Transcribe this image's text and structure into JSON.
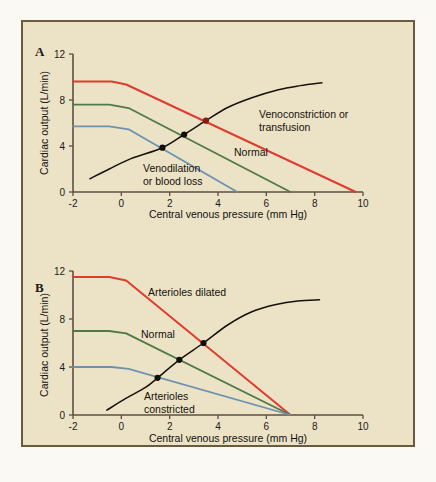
{
  "figure": {
    "background_color": "#ece3c6",
    "border_color": "#6b5b3e",
    "panels": [
      {
        "letter": "A",
        "xlabel": "Central venous pressure (mm Hg)",
        "ylabel": "Cardiac output (L/min)",
        "xticks": [
          "-2",
          "0",
          "2",
          "4",
          "6",
          "8",
          "10"
        ],
        "yticks": [
          "0",
          "4",
          "8",
          "12"
        ],
        "labels": {
          "red": "Venoconstriction or transfusion",
          "green": "Normal",
          "blue": "Venodilation or blood loss"
        }
      },
      {
        "letter": "B",
        "xlabel": "Central venous pressure (mm Hg)",
        "ylabel": "Cardiac output (L/min)",
        "xticks": [
          "-2",
          "0",
          "2",
          "4",
          "6",
          "8",
          "10"
        ],
        "yticks": [
          "0",
          "4",
          "8",
          "12"
        ],
        "labels": {
          "red": "Arterioles dilated",
          "green": "Normal",
          "blue": "Arterioles constricted"
        }
      }
    ]
  },
  "chart_data": [
    {
      "type": "line",
      "panel": "A",
      "title": "",
      "xlabel": "Central venous pressure (mm Hg)",
      "ylabel": "Cardiac output (L/min)",
      "xlim": [
        -2,
        10
      ],
      "ylim": [
        0,
        12
      ],
      "xticks": [
        -2,
        0,
        2,
        4,
        6,
        8,
        10
      ],
      "yticks": [
        0,
        4,
        8,
        12
      ],
      "grid": false,
      "legend": "inline-annotations",
      "series": [
        {
          "name": "Venoconstriction or transfusion",
          "color": "#e03b2e",
          "kind": "vascular-function-curve",
          "points": [
            [
              -2,
              9.6
            ],
            [
              -0.4,
              9.6
            ],
            [
              0.2,
              9.35
            ],
            [
              9.7,
              0
            ]
          ]
        },
        {
          "name": "Normal",
          "color": "#4f7a45",
          "kind": "vascular-function-curve",
          "points": [
            [
              -2,
              7.6
            ],
            [
              -0.5,
              7.6
            ],
            [
              0.3,
              7.3
            ],
            [
              7.0,
              0
            ]
          ]
        },
        {
          "name": "Venodilation or blood loss",
          "color": "#6b93b0",
          "kind": "vascular-function-curve",
          "points": [
            [
              -2,
              5.7
            ],
            [
              -0.5,
              5.7
            ],
            [
              0.3,
              5.45
            ],
            [
              4.8,
              0
            ]
          ]
        },
        {
          "name": "Cardiac function curve",
          "color": "#15120c",
          "kind": "cardiac-function-curve",
          "points": [
            [
              -1.3,
              1.15
            ],
            [
              -0.5,
              2.0
            ],
            [
              0.4,
              2.9
            ],
            [
              1.7,
              3.85
            ],
            [
              2.6,
              5.0
            ],
            [
              3.5,
              6.2
            ],
            [
              4.4,
              7.35
            ],
            [
              5.4,
              8.2
            ],
            [
              6.5,
              8.9
            ],
            [
              7.4,
              9.25
            ],
            [
              8.3,
              9.5
            ]
          ]
        }
      ],
      "intersections": [
        {
          "x": 1.7,
          "y": 3.85,
          "with": "Venodilation or blood loss",
          "color": "#120f08"
        },
        {
          "x": 2.6,
          "y": 5.0,
          "with": "Normal",
          "color": "#120f08"
        },
        {
          "x": 3.5,
          "y": 6.2,
          "with": "Venoconstriction or transfusion",
          "color": "#8d1b12"
        }
      ]
    },
    {
      "type": "line",
      "panel": "B",
      "title": "",
      "xlabel": "Central venous pressure (mm Hg)",
      "ylabel": "Cardiac output (L/min)",
      "xlim": [
        -2,
        10
      ],
      "ylim": [
        0,
        12
      ],
      "xticks": [
        -2,
        0,
        2,
        4,
        6,
        8,
        10
      ],
      "yticks": [
        0,
        4,
        8,
        12
      ],
      "grid": false,
      "legend": "inline-annotations",
      "series": [
        {
          "name": "Arterioles dilated",
          "color": "#e03b2e",
          "kind": "vascular-function-curve",
          "points": [
            [
              -2,
              11.5
            ],
            [
              -0.5,
              11.5
            ],
            [
              0.2,
              11.2
            ],
            [
              7.0,
              0
            ]
          ]
        },
        {
          "name": "Normal",
          "color": "#4f7a45",
          "kind": "vascular-function-curve",
          "points": [
            [
              -2,
              7.0
            ],
            [
              -0.5,
              7.0
            ],
            [
              0.2,
              6.8
            ],
            [
              7.0,
              0
            ]
          ]
        },
        {
          "name": "Arterioles constricted",
          "color": "#6b93b0",
          "kind": "vascular-function-curve",
          "points": [
            [
              -2,
              4.0
            ],
            [
              -0.4,
              4.0
            ],
            [
              0.3,
              3.85
            ],
            [
              7.0,
              0
            ]
          ]
        },
        {
          "name": "Cardiac function curve",
          "color": "#15120c",
          "kind": "cardiac-function-curve",
          "points": [
            [
              -0.6,
              0.4
            ],
            [
              0.2,
              1.4
            ],
            [
              1.0,
              2.3
            ],
            [
              1.5,
              3.1
            ],
            [
              2.4,
              4.6
            ],
            [
              3.4,
              6.0
            ],
            [
              4.4,
              7.5
            ],
            [
              5.4,
              8.6
            ],
            [
              6.4,
              9.2
            ],
            [
              7.3,
              9.5
            ],
            [
              8.2,
              9.6
            ]
          ]
        }
      ],
      "intersections": [
        {
          "x": 1.5,
          "y": 3.1,
          "with": "Arterioles constricted",
          "color": "#120f08"
        },
        {
          "x": 2.4,
          "y": 4.6,
          "with": "Normal",
          "color": "#120f08"
        },
        {
          "x": 3.4,
          "y": 6.0,
          "with": "Arterioles dilated",
          "color": "#120f08"
        }
      ]
    }
  ]
}
